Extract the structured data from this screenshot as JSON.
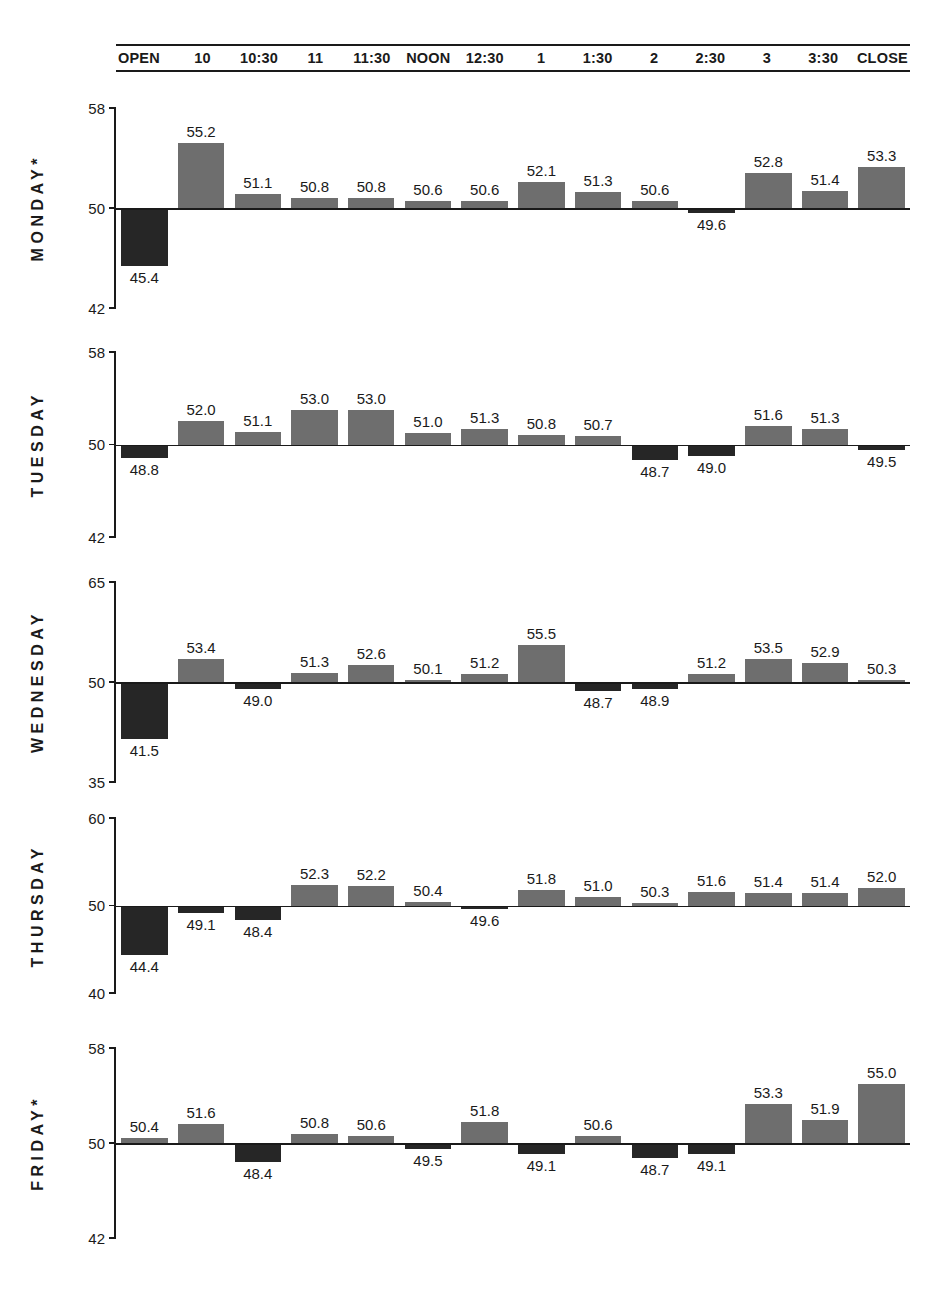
{
  "header": {
    "slots": [
      "OPEN",
      "10",
      "10:30",
      "11",
      "11:30",
      "NOON",
      "12:30",
      "1",
      "1:30",
      "2",
      "2:30",
      "3",
      "3:30",
      "CLOSE"
    ]
  },
  "colors": {
    "up": "#6e6e6e",
    "down": "#262626",
    "axis": "#1a1a1a",
    "background": "#ffffff"
  },
  "chart_data": {
    "type": "bar",
    "title": "",
    "subtitle": "",
    "xlabel": "",
    "ylabel": "",
    "grid": false,
    "legend": "none",
    "baseline": 50,
    "categories": [
      "OPEN",
      "10",
      "10:30",
      "11",
      "11:30",
      "NOON",
      "12:30",
      "1",
      "1:30",
      "2",
      "2:30",
      "3",
      "3:30",
      "CLOSE"
    ],
    "series": [
      {
        "name": "MONDAY*",
        "ylim": [
          42,
          58
        ],
        "yticks": [
          42,
          50,
          58
        ],
        "ytick_labels": [
          "42",
          "50",
          "58"
        ],
        "values": [
          45.4,
          55.2,
          51.1,
          50.8,
          50.8,
          50.6,
          50.6,
          52.1,
          51.3,
          50.6,
          49.6,
          52.8,
          51.4,
          53.3
        ],
        "labels": [
          "45.4",
          "55.2",
          "51.1",
          "50.8",
          "50.8",
          "50.6",
          "50.6",
          "52.1",
          "51.3",
          "50.6",
          "49.6",
          "52.8",
          "51.4",
          "53.3"
        ]
      },
      {
        "name": "TUESDAY",
        "ylim": [
          42,
          58
        ],
        "yticks": [
          42,
          50,
          58
        ],
        "ytick_labels": [
          "42",
          "50",
          "58"
        ],
        "values": [
          48.8,
          52.0,
          51.1,
          53.0,
          53.0,
          51.0,
          51.3,
          50.8,
          50.7,
          48.7,
          49.0,
          51.6,
          51.3,
          49.5
        ],
        "labels": [
          "48.8",
          "52.0",
          "51.1",
          "53.0",
          "53.0",
          "51.0",
          "51.3",
          "50.8",
          "50.7",
          "48.7",
          "49.0",
          "51.6",
          "51.3",
          "49.5"
        ]
      },
      {
        "name": "WEDNESDAY",
        "ylim": [
          35,
          65
        ],
        "yticks": [
          35,
          50,
          65
        ],
        "ytick_labels": [
          "35",
          "50",
          "65"
        ],
        "values": [
          41.5,
          53.4,
          49.0,
          51.3,
          52.6,
          50.1,
          51.2,
          55.5,
          48.7,
          48.9,
          51.2,
          53.5,
          52.9,
          50.3
        ],
        "labels": [
          "41.5",
          "53.4",
          "49.0",
          "51.3",
          "52.6",
          "50.1",
          "51.2",
          "55.5",
          "48.7",
          "48.9",
          "51.2",
          "53.5",
          "52.9",
          "50.3"
        ]
      },
      {
        "name": "THURSDAY",
        "ylim": [
          40,
          60
        ],
        "yticks": [
          40,
          50,
          60
        ],
        "ytick_labels": [
          "40",
          "50",
          "60"
        ],
        "values": [
          44.4,
          49.1,
          48.4,
          52.3,
          52.2,
          50.4,
          49.6,
          51.8,
          51.0,
          50.3,
          51.6,
          51.4,
          51.4,
          52.0
        ],
        "labels": [
          "44.4",
          "49.1",
          "48.4",
          "52.3",
          "52.2",
          "50.4",
          "49.6",
          "51.8",
          "51.0",
          "50.3",
          "51.6",
          "51.4",
          "51.4",
          "52.0"
        ]
      },
      {
        "name": "FRIDAY*",
        "ylim": [
          42,
          58
        ],
        "yticks": [
          42,
          50,
          58
        ],
        "ytick_labels": [
          "42",
          "50",
          "58"
        ],
        "values": [
          50.4,
          51.6,
          48.4,
          50.8,
          50.6,
          49.5,
          51.8,
          49.1,
          50.6,
          48.7,
          49.1,
          53.3,
          51.9,
          55.0
        ],
        "labels": [
          "50.4",
          "51.6",
          "48.4",
          "50.8",
          "50.6",
          "49.5",
          "51.8",
          "49.1",
          "50.6",
          "48.7",
          "49.1",
          "53.3",
          "51.9",
          "55.0"
        ]
      }
    ]
  }
}
